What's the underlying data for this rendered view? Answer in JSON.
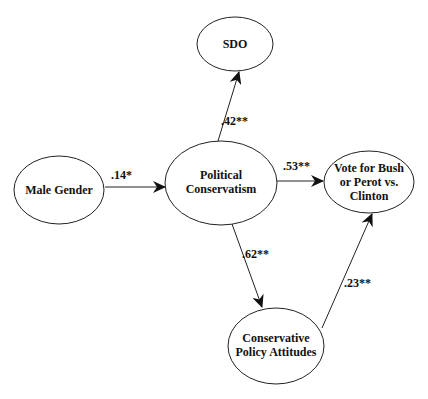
{
  "diagram": {
    "nodes": [
      {
        "id": "sdo",
        "lines": [
          "SDO"
        ],
        "cx": 235,
        "cy": 44,
        "rx": 38,
        "ry": 27
      },
      {
        "id": "male_gender",
        "lines": [
          "Male Gender"
        ],
        "cx": 59,
        "cy": 190,
        "rx": 45,
        "ry": 34
      },
      {
        "id": "political_conservatism",
        "lines": [
          "Political",
          "Conservatism"
        ],
        "cx": 221,
        "cy": 183,
        "rx": 56,
        "ry": 42
      },
      {
        "id": "vote",
        "lines": [
          "Vote for Bush",
          "or Perot vs.",
          "Clinton"
        ],
        "cx": 369,
        "cy": 182,
        "rx": 45,
        "ry": 31
      },
      {
        "id": "policy_attitudes",
        "lines": [
          "Conservative",
          "Policy Attitudes"
        ],
        "cx": 276,
        "cy": 346,
        "rx": 48,
        "ry": 38
      }
    ],
    "edges": [
      {
        "from": "male_gender",
        "to": "political_conservatism",
        "label": ".14*"
      },
      {
        "from": "political_conservatism",
        "to": "sdo",
        "label": ".42**"
      },
      {
        "from": "political_conservatism",
        "to": "vote",
        "label": ".53**"
      },
      {
        "from": "political_conservatism",
        "to": "policy_attitudes",
        "label": ".62**"
      },
      {
        "from": "policy_attitudes",
        "to": "vote",
        "label": ".23**"
      }
    ]
  }
}
